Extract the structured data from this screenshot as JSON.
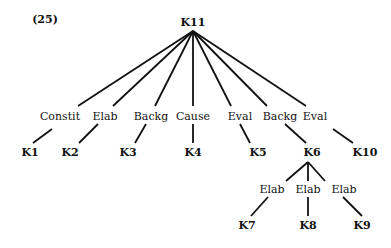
{
  "example_number": "(25)",
  "root": {
    "label": "K11"
  },
  "relations": [
    {
      "label": "Constit",
      "leaf": "K1"
    },
    {
      "label": "Elab",
      "leaf": "K2"
    },
    {
      "label": "Backg",
      "leaf": "K3"
    },
    {
      "label": "Cause",
      "leaf": "K4"
    },
    {
      "label": "Eval",
      "leaf": "K5"
    },
    {
      "label": "Backg",
      "leaf": "K6"
    },
    {
      "label": "Eval",
      "leaf": "K10"
    }
  ],
  "k6_children": [
    {
      "label": "Elab",
      "leaf": "K7"
    },
    {
      "label": "Elab",
      "leaf": "K8"
    },
    {
      "label": "Elab",
      "leaf": "K9"
    }
  ]
}
